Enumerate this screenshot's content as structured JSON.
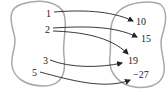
{
  "diagram": {
    "type": "mapping",
    "domain_set": {
      "elements": [
        "1",
        "2",
        "3",
        "5"
      ]
    },
    "codomain_set": {
      "elements": [
        "10",
        "15",
        "19",
        "−27"
      ]
    },
    "arrows": [
      {
        "from": "1",
        "to": "10"
      },
      {
        "from": "2",
        "to": "15"
      },
      {
        "from": "2",
        "to": "19"
      },
      {
        "from": "3",
        "to": "19"
      },
      {
        "from": "5",
        "to": "−27"
      }
    ],
    "colors": {
      "set_outline": "#a8a8a8",
      "arrow": "#222222",
      "text": "#222222"
    }
  }
}
